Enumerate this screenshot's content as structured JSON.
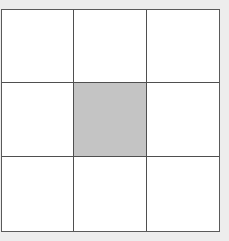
{
  "diagram": {
    "type": "grid",
    "rows": 3,
    "columns": 3,
    "colors": {
      "background": "#ededed",
      "cell_fill": "#ffffff",
      "shaded_fill": "#c4c4c4",
      "line": "#505050"
    },
    "cells": [
      {
        "row": 0,
        "col": 0,
        "shaded": false
      },
      {
        "row": 0,
        "col": 1,
        "shaded": false
      },
      {
        "row": 0,
        "col": 2,
        "shaded": false
      },
      {
        "row": 1,
        "col": 0,
        "shaded": false
      },
      {
        "row": 1,
        "col": 1,
        "shaded": true
      },
      {
        "row": 1,
        "col": 2,
        "shaded": false
      },
      {
        "row": 2,
        "col": 0,
        "shaded": false
      },
      {
        "row": 2,
        "col": 1,
        "shaded": false
      },
      {
        "row": 2,
        "col": 2,
        "shaded": false
      }
    ]
  }
}
